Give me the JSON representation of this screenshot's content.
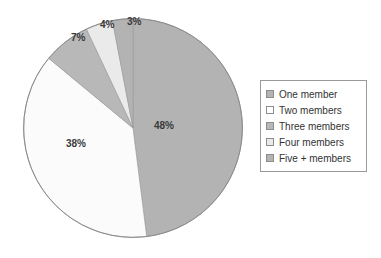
{
  "chart_data": {
    "type": "pie",
    "title": "",
    "categories": [
      "One member",
      "Two members",
      "Three members",
      "Four members",
      "Five + members"
    ],
    "values": [
      48,
      38,
      7,
      4,
      3
    ],
    "data_labels": [
      "48%",
      "38%",
      "7%",
      "4%",
      "3%"
    ],
    "units": "percent",
    "legend_position": "right",
    "grid": false,
    "slice_colors": [
      "#b3b3b3",
      "#fbfbfb",
      "#b8b8b8",
      "#eaeaea",
      "#b3b3b3"
    ],
    "start_angle_deg": 0,
    "direction": "clockwise",
    "slices": [
      {
        "label": "One member",
        "value": 48,
        "data_label": "48%",
        "color": "#b3b3b3"
      },
      {
        "label": "Two members",
        "value": 38,
        "data_label": "38%",
        "color": "#fbfbfb"
      },
      {
        "label": "Three members",
        "value": 7,
        "data_label": "7%",
        "color": "#b8b8b8"
      },
      {
        "label": "Four members",
        "value": 4,
        "data_label": "4%",
        "color": "#eaeaea"
      },
      {
        "label": "Five + members",
        "value": 3,
        "data_label": "3%",
        "color": "#b3b3b3"
      }
    ]
  },
  "pie": {
    "outline_color": "#8a8a8a",
    "label_one": "48%",
    "label_two": "38%",
    "label_three": "7%",
    "label_four": "4%",
    "label_five": "3%"
  },
  "legend": {
    "border_color": "#9a9a9a",
    "items": [
      {
        "label": "One member",
        "swatch": "#b3b3b3"
      },
      {
        "label": "Two members",
        "swatch": "#ffffff"
      },
      {
        "label": "Three members",
        "swatch": "#b8b8b8"
      },
      {
        "label": "Four members",
        "swatch": "#eaeaea"
      },
      {
        "label": "Five + members",
        "swatch": "#b3b3b3"
      }
    ]
  }
}
